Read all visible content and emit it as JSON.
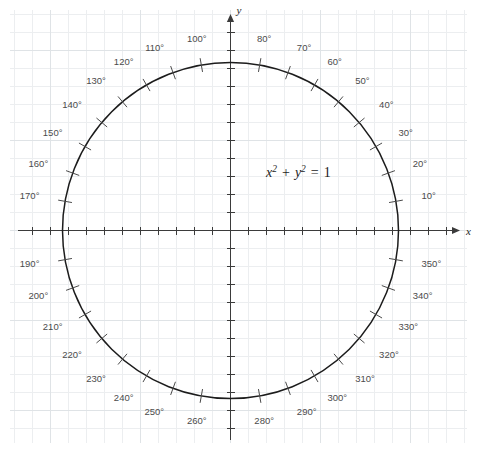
{
  "figure": {
    "type": "unit-circle-degree-diagram",
    "equation_label": "x² + y² = 1",
    "equation_parts": {
      "x_var": "x",
      "x_exp": "2",
      "plus": "+",
      "y_var": "y",
      "y_exp": "2",
      "equals": "=",
      "value": "1"
    },
    "axis_labels": {
      "x": "x",
      "y": "y"
    },
    "colors": {
      "background": "#ffffff",
      "grid_minor": "#eceef0",
      "grid_major": "#dfe3e6",
      "axis": "#3b3b3b",
      "circle": "#1c1c1c",
      "degree_label": "#4b4b4b",
      "degree_tick": "#4a4a4a"
    }
  },
  "chart_data": {
    "type": "scatter",
    "xlabel": "x",
    "ylabel": "y",
    "xlim": [
      -1.32,
      1.32
    ],
    "ylim": [
      -1.32,
      1.32
    ],
    "grid": true,
    "legend": null,
    "annotations": [
      "x² + y² = 1"
    ],
    "circle": {
      "center": [
        0,
        0
      ],
      "radius": 1
    },
    "degree_marks": [
      {
        "label": "10°",
        "angle": 10
      },
      {
        "label": "20°",
        "angle": 20
      },
      {
        "label": "30°",
        "angle": 30
      },
      {
        "label": "40°",
        "angle": 40
      },
      {
        "label": "50°",
        "angle": 50
      },
      {
        "label": "60°",
        "angle": 60
      },
      {
        "label": "70°",
        "angle": 70
      },
      {
        "label": "80°",
        "angle": 80
      },
      {
        "label": "100°",
        "angle": 100
      },
      {
        "label": "110°",
        "angle": 110
      },
      {
        "label": "120°",
        "angle": 120
      },
      {
        "label": "130°",
        "angle": 130
      },
      {
        "label": "140°",
        "angle": 140
      },
      {
        "label": "150°",
        "angle": 150
      },
      {
        "label": "160°",
        "angle": 160
      },
      {
        "label": "170°",
        "angle": 170
      },
      {
        "label": "190°",
        "angle": 190
      },
      {
        "label": "200°",
        "angle": 200
      },
      {
        "label": "210°",
        "angle": 210
      },
      {
        "label": "220°",
        "angle": 220
      },
      {
        "label": "230°",
        "angle": 230
      },
      {
        "label": "240°",
        "angle": 240
      },
      {
        "label": "250°",
        "angle": 250
      },
      {
        "label": "260°",
        "angle": 260
      },
      {
        "label": "280°",
        "angle": 280
      },
      {
        "label": "290°",
        "angle": 290
      },
      {
        "label": "300°",
        "angle": 300
      },
      {
        "label": "310°",
        "angle": 310
      },
      {
        "label": "320°",
        "angle": 320
      },
      {
        "label": "330°",
        "angle": 330
      },
      {
        "label": "340°",
        "angle": 340
      },
      {
        "label": "350°",
        "angle": 350
      }
    ],
    "axis_tick_count_per_side": 12,
    "degree_step": 10
  },
  "geometry": {
    "origin_x": 230.5,
    "origin_y": 230.5,
    "radius_px": 168,
    "axis_tick_spacing_px": 18,
    "grid_minor_spacing_px": 18,
    "grid_major_every": 5,
    "grid_left": 10,
    "grid_top": 10,
    "grid_right": 467,
    "grid_bottom": 443,
    "x_axis_start": 18,
    "x_axis_end": 452,
    "y_axis_start": 22,
    "y_axis_end": 440,
    "degree_label_radius_px": 194,
    "tick_inner_px": 161,
    "tick_outer_px": 175
  }
}
